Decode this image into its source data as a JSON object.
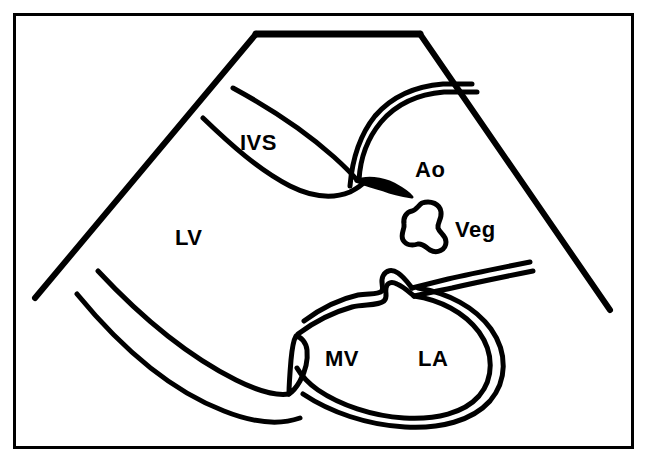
{
  "figure": {
    "kind": "line-diagram",
    "background_color": "#ffffff",
    "ink_color": "#000000",
    "frame": {
      "name": "outer-border",
      "x": 14,
      "y": 14,
      "width": 619,
      "height": 434,
      "stroke_width": 3
    },
    "sector": {
      "name": "ultrasound-sector-outline",
      "apex_left_x": 256,
      "apex_right_x": 420,
      "apex_y": 34,
      "left_edge_end_x": 35,
      "left_edge_end_y": 298,
      "right_edge_end_x": 610,
      "right_edge_end_y": 310
    },
    "labels": [
      {
        "id": "ivs",
        "text": "IVS",
        "x": 240,
        "y": 150,
        "structure": "interventricular septum"
      },
      {
        "id": "ao",
        "text": "Ao",
        "x": 415,
        "y": 177,
        "structure": "aorta"
      },
      {
        "id": "veg",
        "text": "Veg",
        "x": 455,
        "y": 237,
        "structure": "vegetation"
      },
      {
        "id": "lv",
        "text": "LV",
        "x": 175,
        "y": 245,
        "structure": "left ventricle"
      },
      {
        "id": "mv",
        "text": "MV",
        "x": 325,
        "y": 366,
        "structure": "mitral valve"
      },
      {
        "id": "la",
        "text": "LA",
        "x": 418,
        "y": 366,
        "structure": "left atrium"
      }
    ],
    "structures": [
      {
        "id": "ivs-outline",
        "name": "interventricular-septum-outline"
      },
      {
        "id": "aorta-outline",
        "name": "aortic-root-outline"
      },
      {
        "id": "aortic-valve",
        "name": "aortic-valve-leaflet"
      },
      {
        "id": "vegetation-blob",
        "name": "vegetation-mass"
      },
      {
        "id": "mitral-valve-outline",
        "name": "mitral-valve-leaflets"
      },
      {
        "id": "la-outline",
        "name": "left-atrium-outline"
      },
      {
        "id": "lv-posterior-wall",
        "name": "left-ventricle-posterior-wall"
      }
    ]
  }
}
